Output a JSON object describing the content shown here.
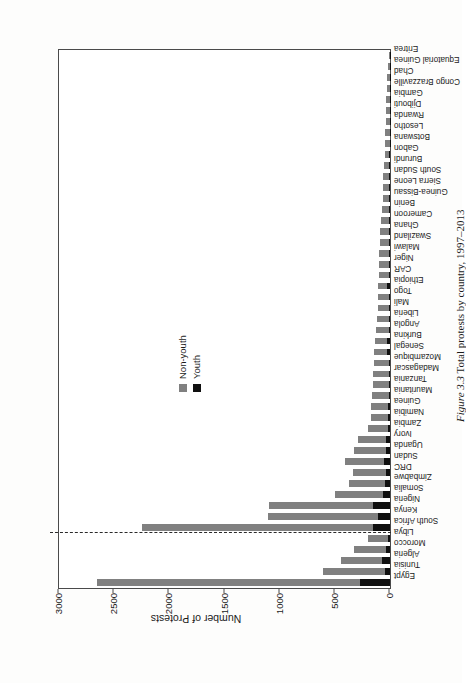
{
  "figure": {
    "caption_label": "Figure 3.3",
    "caption_text": "Total protests by country, 1997–2013",
    "orientation": "rotated-90-landscape"
  },
  "legend": {
    "position": "upper-left-inside",
    "items": [
      {
        "label": "Non-youth",
        "color": "#808080",
        "icon": "square-swatch"
      },
      {
        "label": "Youth",
        "color": "#101010",
        "icon": "square-swatch"
      }
    ]
  },
  "annotations": {
    "region_divider": {
      "style": "dashed",
      "after_category": "Libya",
      "meaning": "separates North Africa block from Sub-Saharan Africa block"
    }
  },
  "chart_data": {
    "type": "bar",
    "subtype": "stacked-horizontal",
    "title": "",
    "xlabel": "",
    "ylabel": "Number of Protests",
    "ylim": [
      0,
      3000
    ],
    "yticks": [
      0,
      500,
      1000,
      1500,
      2000,
      2500,
      3000
    ],
    "ytick_labels": [
      "0",
      "500",
      "1000",
      "1500",
      "2000",
      "2500",
      "3000"
    ],
    "grid": false,
    "legend_position": "inside-upper-left",
    "stack_order": [
      "Youth",
      "Non-youth"
    ],
    "categories": [
      "Egypt",
      "Tunisia",
      "Algeria",
      "Morocco",
      "Libya",
      "South Africa",
      "Kenya",
      "Nigeria",
      "Somalia",
      "Zimbabwe",
      "DRC",
      "Sudan",
      "Uganda",
      "Ivory",
      "Zambia",
      "Namibia",
      "Guinea",
      "Mauritania",
      "Tanzania",
      "Madagascar",
      "Mozambique",
      "Senegal",
      "Burkina",
      "Angola",
      "Liberia",
      "Mali",
      "Togo",
      "Ethiopia",
      "CAR",
      "Niger",
      "Malawi",
      "Swaziland",
      "Ghana",
      "Cameroon",
      "Benin",
      "Guinea-Bissau",
      "Sierra Leone",
      "South Sudan",
      "Burundi",
      "Gabon",
      "Botswana",
      "Lesotho",
      "Rwanda",
      "Djibouti",
      "Gambia",
      "Congo Brazzaville",
      "Chad",
      "Equatorial Guinea",
      "Eritrea"
    ],
    "series": [
      {
        "name": "Youth",
        "color": "#101010",
        "values": [
          270,
          48,
          70,
          36,
          18,
          150,
          112,
          155,
          60,
          42,
          40,
          55,
          38,
          40,
          22,
          14,
          18,
          12,
          12,
          10,
          8,
          26,
          24,
          10,
          10,
          12,
          10,
          28,
          8,
          8,
          8,
          8,
          8,
          6,
          6,
          6,
          8,
          10,
          8,
          10,
          4,
          4,
          4,
          4,
          4,
          2,
          4,
          2,
          2
        ]
      },
      {
        "name": "Non-youth",
        "color": "#808080",
        "values": [
          2390,
          560,
          375,
          290,
          180,
          2100,
          990,
          940,
          440,
          330,
          300,
          355,
          290,
          250,
          180,
          160,
          155,
          150,
          145,
          140,
          140,
          115,
          115,
          120,
          110,
          100,
          100,
          80,
          95,
          90,
          88,
          85,
          80,
          72,
          68,
          62,
          56,
          50,
          48,
          40,
          42,
          40,
          36,
          32,
          30,
          28,
          24,
          16,
          10
        ]
      }
    ],
    "totals": [
      2660,
      608,
      445,
      326,
      198,
      2250,
      1102,
      1095,
      500,
      372,
      340,
      410,
      328,
      290,
      202,
      174,
      173,
      162,
      157,
      150,
      148,
      141,
      139,
      130,
      120,
      112,
      110,
      108,
      103,
      98,
      96,
      93,
      88,
      78,
      74,
      68,
      64,
      60,
      56,
      50,
      46,
      44,
      40,
      36,
      34,
      30,
      28,
      18,
      12
    ]
  }
}
